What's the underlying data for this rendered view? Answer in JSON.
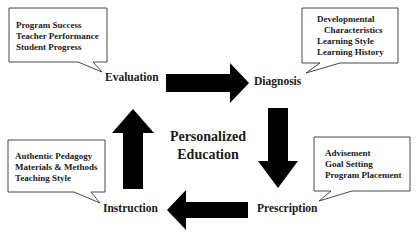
{
  "diagram": {
    "center": {
      "line1": "Personalized",
      "line2": "Education"
    },
    "stages": [
      {
        "name": "Evaluation",
        "callout": [
          "Program Success",
          "Teacher Performance",
          "Student Progress"
        ]
      },
      {
        "name": "Diagnosis",
        "callout": [
          "Developmental",
          "Characteristics",
          "Learning Style",
          "Learning History"
        ]
      },
      {
        "name": "Prescription",
        "callout": [
          "Advisement",
          "Goal Setting",
          "Program Placement"
        ]
      },
      {
        "name": "Instruction",
        "callout": [
          "Authentic Pedagogy",
          "Materials & Methods",
          "Teaching Style"
        ]
      }
    ],
    "flow": [
      {
        "from": "Evaluation",
        "to": "Diagnosis",
        "direction": "right"
      },
      {
        "from": "Diagnosis",
        "to": "Prescription",
        "direction": "down"
      },
      {
        "from": "Prescription",
        "to": "Instruction",
        "direction": "left"
      },
      {
        "from": "Instruction",
        "to": "Evaluation",
        "direction": "up"
      }
    ],
    "colors": {
      "arrow": "#000000",
      "callout_border": "#333333",
      "callout_fill": "#ffffff",
      "text": "#1a1a1a"
    }
  }
}
